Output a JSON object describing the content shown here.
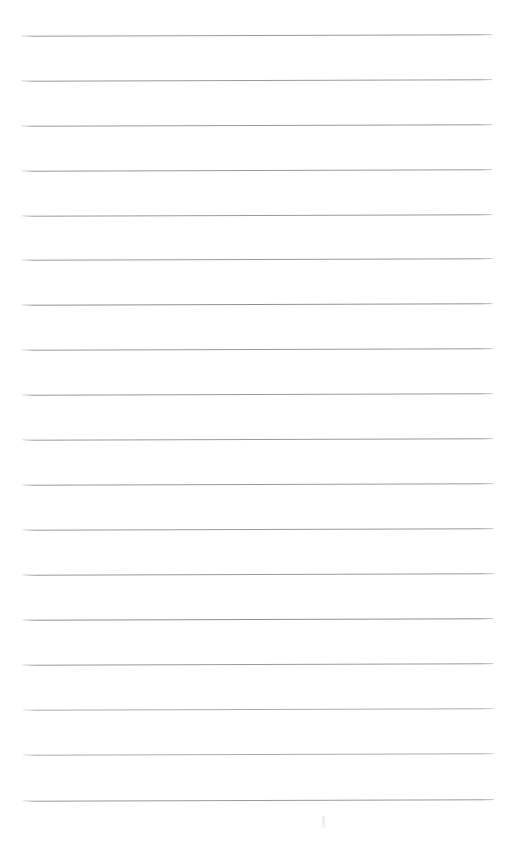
{
  "document": {
    "kind": "scanned-blank-lined-page",
    "title": "Blank Lined Page",
    "body_text": "",
    "handwriting": "",
    "printed_text": "",
    "page_number": "",
    "header_text": "",
    "footer_text": ""
  },
  "canvas": {
    "width": 509,
    "height": 864,
    "background_color": "#ffffff",
    "paper_color": "#ffffff"
  },
  "ruling": {
    "line_color": "#8c8c8c",
    "line_thickness_px": 1,
    "line_count": 18,
    "line_left_x": 22,
    "line_right_x": 493,
    "line_length_px": 471,
    "first_line_y": 35,
    "last_line_y": 800,
    "line_spacing_px": 45,
    "top_margin_px": 35,
    "bottom_margin_px": 64,
    "left_margin_px": 22,
    "right_margin_px": 16,
    "skew_degrees": -0.16,
    "lines": [
      {
        "index": 1,
        "y": 35,
        "weight": "normal"
      },
      {
        "index": 2,
        "y": 80,
        "weight": "normal"
      },
      {
        "index": 3,
        "y": 125,
        "weight": "normal"
      },
      {
        "index": 4,
        "y": 170,
        "weight": "normal"
      },
      {
        "index": 5,
        "y": 215,
        "weight": "normal"
      },
      {
        "index": 6,
        "y": 259,
        "weight": "normal"
      },
      {
        "index": 7,
        "y": 304,
        "weight": "strong"
      },
      {
        "index": 8,
        "y": 349,
        "weight": "normal"
      },
      {
        "index": 9,
        "y": 394,
        "weight": "normal"
      },
      {
        "index": 10,
        "y": 439,
        "weight": "normal"
      },
      {
        "index": 11,
        "y": 484,
        "weight": "normal"
      },
      {
        "index": 12,
        "y": 529,
        "weight": "normal"
      },
      {
        "index": 13,
        "y": 574,
        "weight": "normal"
      },
      {
        "index": 14,
        "y": 619,
        "weight": "strong"
      },
      {
        "index": 15,
        "y": 664,
        "weight": "normal"
      },
      {
        "index": 16,
        "y": 709,
        "weight": "faint"
      },
      {
        "index": 17,
        "y": 754,
        "weight": "faint"
      },
      {
        "index": 18,
        "y": 800,
        "weight": "normal"
      }
    ]
  },
  "artifacts": [
    {
      "name": "scan-speck",
      "x": 322,
      "y": 816,
      "color": "#e9e9ea"
    }
  ]
}
